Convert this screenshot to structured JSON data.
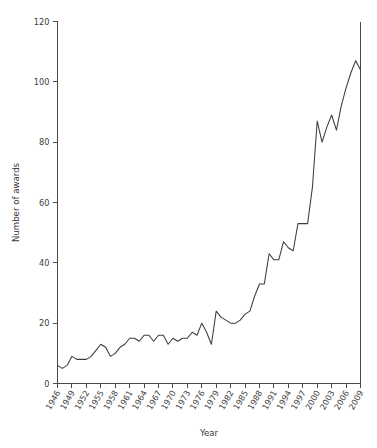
{
  "chart_data": {
    "type": "line",
    "title": "",
    "xlabel": "Year",
    "ylabel": "Number of awards",
    "xlim": [
      1946,
      2009
    ],
    "ylim": [
      0,
      120
    ],
    "grid": false,
    "legend": null,
    "y_ticks": [
      0,
      20,
      40,
      60,
      80,
      100,
      120
    ],
    "y_tick_labels": [
      "0",
      "20",
      "40",
      "60",
      "80",
      "100",
      "120"
    ],
    "x_ticks": [
      1946,
      1949,
      1952,
      1955,
      1958,
      1961,
      1964,
      1967,
      1970,
      1973,
      1976,
      1979,
      1982,
      1985,
      1988,
      1991,
      1994,
      1997,
      2000,
      2003,
      2006,
      2009
    ],
    "x_tick_labels": [
      "1946",
      "1949",
      "1952",
      "1955",
      "1958",
      "1961",
      "1964",
      "1967",
      "1970",
      "1973",
      "1976",
      "1979",
      "1982",
      "1985",
      "1988",
      "1991",
      "1994",
      "1997",
      "2000",
      "2003",
      "2006",
      "2009"
    ],
    "x_minor_ticks_every": 3,
    "x": [
      1946,
      1947,
      1948,
      1949,
      1950,
      1951,
      1952,
      1953,
      1954,
      1955,
      1956,
      1957,
      1958,
      1959,
      1960,
      1961,
      1962,
      1963,
      1964,
      1965,
      1966,
      1967,
      1968,
      1969,
      1970,
      1971,
      1972,
      1973,
      1974,
      1975,
      1976,
      1977,
      1978,
      1979,
      1980,
      1981,
      1982,
      1983,
      1984,
      1985,
      1986,
      1987,
      1988,
      1989,
      1990,
      1991,
      1992,
      1993,
      1994,
      1995,
      1996,
      1997,
      1998,
      1999,
      2000,
      2001,
      2002,
      2003,
      2004,
      2005,
      2006,
      2007,
      2008,
      2009
    ],
    "values": [
      6,
      5,
      6,
      9,
      8,
      8,
      8,
      9,
      11,
      13,
      12,
      9,
      10,
      12,
      13,
      15,
      15,
      14,
      16,
      16,
      14,
      16,
      16,
      13,
      15,
      14,
      15,
      15,
      17,
      16,
      20,
      17,
      13,
      24,
      22,
      21,
      20,
      20,
      21,
      23,
      24,
      29,
      33,
      33,
      43,
      41,
      41,
      47,
      45,
      44,
      53,
      53,
      53,
      65,
      87,
      80,
      85,
      89,
      84,
      92,
      98,
      103,
      107,
      104
    ],
    "series_color": "#3c3c3c",
    "series_name": "Number of awards"
  },
  "layout": {
    "axis_color": "#4a4a4a",
    "background": "#ffffff",
    "text_color": "#3a3a3a"
  }
}
